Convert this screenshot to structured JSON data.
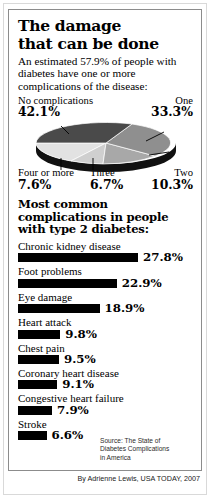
{
  "title_line1": "The damage",
  "title_line2": "that can be done",
  "subtitle": "An estimated 57.9% of people with diabetes have one or more complications of the disease:",
  "bars_heading": "Most common complications in people with type 2 diabetes:",
  "source": {
    "line1": "Source: The State of",
    "line2": "Diabetes Complications",
    "line3": "in America"
  },
  "byline": "By Adrienne Lewis, USA TODAY, 2007",
  "colors": {
    "bar": "#000000",
    "pie_none": "#4a4a4a",
    "pie_one": "#8f8f8f",
    "pie_two": "#a8a8a8",
    "pie_three": "#cfcfcf",
    "pie_four": "#e2e2e2",
    "pie_rim": "#111111",
    "frame": "#8c8c8c"
  },
  "chart_data": [
    {
      "type": "pie",
      "title": "Number of complications among people with diabetes",
      "labels": [
        "No complications",
        "One",
        "Two",
        "Three",
        "Four or more"
      ],
      "values": [
        42.1,
        33.3,
        10.3,
        6.7,
        7.6
      ],
      "value_labels": [
        "42.1%",
        "33.3%",
        "10.3%",
        "6.7%",
        "7.6%"
      ],
      "legend": "labels placed around pie with leader lines",
      "units": "percent"
    },
    {
      "type": "bar",
      "orientation": "horizontal",
      "title": "Most common complications in people with type 2 diabetes:",
      "categories": [
        "Chronic kidney disease",
        "Foot problems",
        "Eye damage",
        "Heart attack",
        "Chest pain",
        "Coronary heart disease",
        "Congestive heart failure",
        "Stroke"
      ],
      "values": [
        27.8,
        22.9,
        18.9,
        9.8,
        9.5,
        9.1,
        7.9,
        6.6
      ],
      "value_labels": [
        "27.8%",
        "22.9%",
        "18.9%",
        "9.8%",
        "9.5%",
        "9.1%",
        "7.9%",
        "6.6%"
      ],
      "xlabel": "",
      "ylabel": "",
      "xlim": [
        0,
        27.8
      ],
      "grid": false,
      "units": "percent"
    }
  ]
}
